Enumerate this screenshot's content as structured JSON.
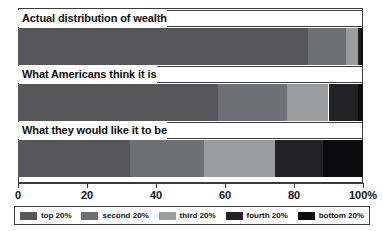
{
  "chart_data": {
    "type": "bar",
    "orientation": "horizontal",
    "stacked": true,
    "title": "",
    "xlabel": "",
    "ylabel": "",
    "xlim": [
      0,
      100
    ],
    "grid": false,
    "legend_position": "bottom",
    "categories": [
      "Actual distribution of wealth",
      "What Americans think it is",
      "What they would like it to be"
    ],
    "series": [
      {
        "name": "top 20%",
        "color": "#57575a",
        "values": [
          84.0,
          58.0,
          32.5
        ]
      },
      {
        "name": "second 20%",
        "color": "#6f7073",
        "values": [
          11.0,
          20.0,
          21.5
        ]
      },
      {
        "name": "third 20%",
        "color": "#9b9c9e",
        "values": [
          3.5,
          12.0,
          20.5
        ]
      },
      {
        "name": "fourth 20%",
        "color": "#232326",
        "values": [
          1.0,
          8.5,
          14.0
        ]
      },
      {
        "name": "bottom 20%",
        "color": "#0c0c0e",
        "values": [
          0.5,
          1.5,
          11.5
        ]
      }
    ],
    "xticks": [
      0,
      20,
      40,
      60,
      80,
      100
    ],
    "xtick_labels": [
      "0",
      "20",
      "40",
      "60",
      "80",
      "100%"
    ],
    "legend_entries": [
      "top 20%",
      "second 20%",
      "third 20%",
      "fourth 20%",
      "bottom 20%"
    ]
  }
}
